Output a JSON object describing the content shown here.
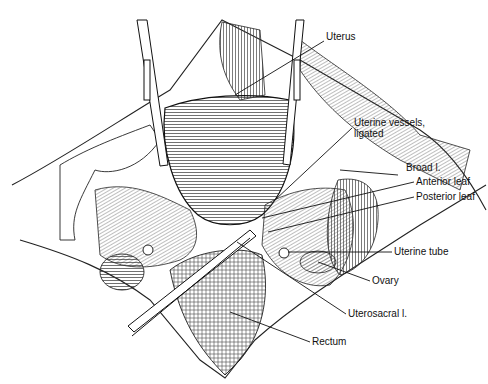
{
  "figure": {
    "labels": [
      {
        "id": "uterus",
        "text": "Uterus",
        "x": 326,
        "y": 36
      },
      {
        "id": "uterine-vessels",
        "line1": "Uterine vessels,",
        "line2": "ligated",
        "x": 354,
        "y": 122
      },
      {
        "id": "broad-l",
        "text": "Broad l.",
        "x": 406,
        "y": 166
      },
      {
        "id": "anterior-leaf",
        "text": "Anterior leaf",
        "x": 416,
        "y": 178
      },
      {
        "id": "posterior-leaf",
        "text": "Posterior leaf",
        "x": 416,
        "y": 193
      },
      {
        "id": "uterine-tube",
        "text": "Uterine tube",
        "x": 394,
        "y": 248
      },
      {
        "id": "ovary",
        "text": "Ovary",
        "x": 372,
        "y": 277
      },
      {
        "id": "uterosacral-l",
        "text": "Uterosacral l.",
        "x": 348,
        "y": 310
      },
      {
        "id": "rectum",
        "text": "Rectum",
        "x": 312,
        "y": 338
      }
    ]
  }
}
